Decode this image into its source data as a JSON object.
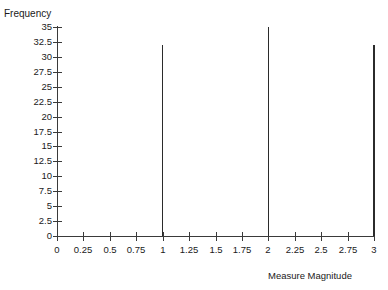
{
  "chart_data": {
    "type": "bar",
    "title": "",
    "xlabel": "Measure Magnitude",
    "ylabel": "Frequency",
    "xlim": [
      0,
      3
    ],
    "ylim": [
      0,
      35
    ],
    "grid": false,
    "legend": null,
    "x_ticks": [
      0,
      0.25,
      0.5,
      0.75,
      1,
      1.25,
      1.5,
      1.75,
      2,
      2.25,
      2.5,
      2.75,
      3
    ],
    "x_tick_labels": [
      "0",
      "0.25",
      "0.5",
      "0.75",
      "1",
      "1.25",
      "1.5",
      "1.75",
      "2",
      "2.25",
      "2.5",
      "2.75",
      "3"
    ],
    "y_ticks": [
      0,
      2.5,
      5,
      7.5,
      10,
      12.5,
      15,
      17.5,
      20,
      22.5,
      25,
      27.5,
      30,
      32.5,
      35
    ],
    "y_tick_labels": [
      "0",
      "2.5",
      "5",
      "7.5",
      "10",
      "12.5",
      "15",
      "17.5",
      "20",
      "22.5",
      "25",
      "27.5",
      "30",
      "32.5",
      "35"
    ],
    "x": [
      1,
      2,
      3
    ],
    "values": [
      32,
      35,
      32
    ],
    "bar_color": "#2b2b2b",
    "axis_color": "#3a3a3a"
  },
  "axes": {
    "y_title": "Frequency",
    "x_title": "Measure Magnitude"
  }
}
